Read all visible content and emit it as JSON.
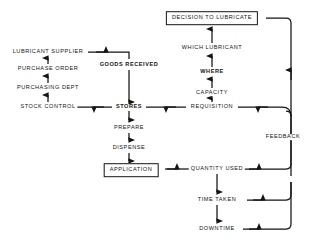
{
  "diagram": {
    "line_color": "#141414",
    "background_color": "#ffffff",
    "nodes": [
      {
        "id": "decision",
        "label": "DECISION TO LUBRICATE",
        "x": 212,
        "y": 18,
        "boxed": true,
        "bold": false
      },
      {
        "id": "which_lubricant",
        "label": "WHICH LUBRICANT",
        "x": 212,
        "y": 48,
        "boxed": false,
        "bold": false
      },
      {
        "id": "where",
        "label": "WHERE",
        "x": 212,
        "y": 72,
        "boxed": false,
        "bold": true
      },
      {
        "id": "capacity",
        "label": "CAPACITY",
        "x": 212,
        "y": 93,
        "boxed": false,
        "bold": false
      },
      {
        "id": "requisition",
        "label": "REQUISITION",
        "x": 212,
        "y": 107,
        "boxed": false,
        "bold": false
      },
      {
        "id": "lubricant_supplier",
        "label": "LUBRICANT SUPPLIER",
        "x": 48,
        "y": 52,
        "boxed": false,
        "bold": false
      },
      {
        "id": "purchase_order",
        "label": "PURCHASE ORDER",
        "x": 48,
        "y": 69,
        "boxed": false,
        "bold": false
      },
      {
        "id": "purchasing_dept",
        "label": "PURCHASING  DEPT",
        "x": 48,
        "y": 88,
        "boxed": false,
        "bold": false
      },
      {
        "id": "stock_control",
        "label": "STOCK CONTROL",
        "x": 48,
        "y": 107,
        "boxed": false,
        "bold": false
      },
      {
        "id": "goods_received",
        "label": "GOODS RECEIVED",
        "x": 129,
        "y": 65,
        "boxed": false,
        "bold": true
      },
      {
        "id": "stores",
        "label": "STORES",
        "x": 129,
        "y": 107,
        "boxed": false,
        "bold": true
      },
      {
        "id": "prepare",
        "label": "PREPARE",
        "x": 129,
        "y": 128,
        "boxed": false,
        "bold": false
      },
      {
        "id": "dispense",
        "label": "DISPENSE",
        "x": 129,
        "y": 148,
        "boxed": false,
        "bold": false
      },
      {
        "id": "application",
        "label": "APPLICATION",
        "x": 131,
        "y": 170,
        "boxed": true,
        "bold": false
      },
      {
        "id": "quantity_used",
        "label": "QUANTITY USED",
        "x": 217,
        "y": 169,
        "boxed": false,
        "bold": false
      },
      {
        "id": "time_taken",
        "label": "TIME TAKEN",
        "x": 217,
        "y": 200,
        "boxed": false,
        "bold": false
      },
      {
        "id": "downtime",
        "label": "DOWNTIME",
        "x": 217,
        "y": 229,
        "boxed": false,
        "bold": false
      },
      {
        "id": "feedback",
        "label": "FEEDBACK",
        "x": 283,
        "y": 137,
        "boxed": false,
        "bold": false
      }
    ],
    "edges": [
      {
        "from": "requisition",
        "to": "capacity",
        "direction": "up"
      },
      {
        "from": "capacity",
        "to": "where",
        "direction": "up"
      },
      {
        "from": "where",
        "to": "which_lubricant",
        "direction": "up"
      },
      {
        "from": "which_lubricant",
        "to": "decision",
        "direction": "up"
      },
      {
        "from": "stock_control",
        "to": "purchasing_dept",
        "direction": "up"
      },
      {
        "from": "purchasing_dept",
        "to": "purchase_order",
        "direction": "up"
      },
      {
        "from": "purchase_order",
        "to": "lubricant_supplier",
        "direction": "up"
      },
      {
        "from": "lubricant_supplier",
        "to": "goods_received",
        "direction": "right-down"
      },
      {
        "from": "goods_received",
        "to": "stores",
        "direction": "down"
      },
      {
        "from": "stores",
        "to": "stock_control",
        "direction": "left"
      },
      {
        "from": "requisition",
        "to": "stores",
        "direction": "left"
      },
      {
        "from": "stores",
        "to": "prepare",
        "direction": "down"
      },
      {
        "from": "prepare",
        "to": "dispense",
        "direction": "down"
      },
      {
        "from": "dispense",
        "to": "application",
        "direction": "down"
      },
      {
        "from": "application",
        "to": "quantity_used",
        "direction": "right"
      },
      {
        "from": "quantity_used",
        "to": "time_taken",
        "direction": "down"
      },
      {
        "from": "time_taken",
        "to": "downtime",
        "direction": "down"
      },
      {
        "from": "quantity_used",
        "to": "feedback",
        "direction": "right"
      },
      {
        "from": "time_taken",
        "to": "feedback",
        "direction": "right"
      },
      {
        "from": "downtime",
        "to": "feedback",
        "direction": "right"
      },
      {
        "from": "feedback",
        "to": "requisition",
        "direction": "up-left"
      },
      {
        "from": "decision",
        "to": "feedback",
        "direction": "right-down"
      }
    ]
  }
}
